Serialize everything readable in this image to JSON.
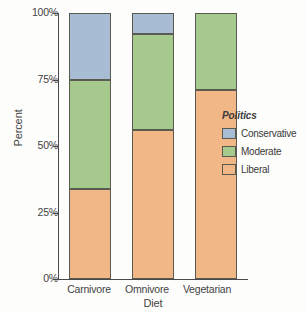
{
  "chart_data": {
    "type": "bar",
    "stacked": true,
    "stack_normalized": true,
    "title": "",
    "xlabel": "Diet",
    "ylabel": "Percent",
    "categories": [
      "Carnivore",
      "Omnivore",
      "Vegetarian"
    ],
    "series": [
      {
        "name": "Conservative",
        "values": [
          25,
          8,
          0
        ],
        "color": "#a8bcd3"
      },
      {
        "name": "Moderate",
        "values": [
          41,
          36,
          29
        ],
        "color": "#a6c98d"
      },
      {
        "name": "Liberal",
        "values": [
          34,
          56,
          71
        ],
        "color": "#f2b787"
      }
    ],
    "stack_order_bottom_to_top": [
      "Liberal",
      "Moderate",
      "Conservative"
    ],
    "ylim": [
      0,
      100
    ],
    "ytick_labels": [
      "0%",
      "25%",
      "50%",
      "75%",
      "100%"
    ],
    "ytick_values": [
      0,
      25,
      50,
      75,
      100
    ],
    "grid": false,
    "legend_position": "right",
    "legend_title": "Politics"
  },
  "axes": {
    "y_title": "Percent",
    "x_title": "Diet",
    "y_ticks": [
      {
        "label": "100%",
        "value": 100
      },
      {
        "label": "75%",
        "value": 75
      },
      {
        "label": "50%",
        "value": 50
      },
      {
        "label": "25%",
        "value": 25
      },
      {
        "label": "0%",
        "value": 0
      }
    ],
    "x_ticks": [
      "Carnivore",
      "Omnivore",
      "Vegetarian"
    ]
  },
  "legend": {
    "title": "Politics",
    "items": [
      {
        "label": "Conservative",
        "color": "#a8bcd3"
      },
      {
        "label": "Moderate",
        "color": "#a6c98d"
      },
      {
        "label": "Liberal",
        "color": "#f2b787"
      }
    ]
  },
  "style": {
    "axis_color": "#4a4a4a",
    "segment_border": "#5a5a50",
    "background": "#fdfdfc",
    "text_color": "#434343"
  }
}
